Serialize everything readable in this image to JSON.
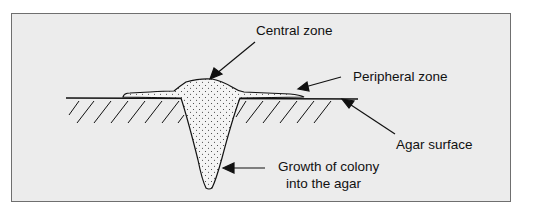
{
  "diagram": {
    "labels": {
      "central_zone": "Central zone",
      "peripheral_zone": "Peripheral zone",
      "agar_surface": "Agar surface",
      "growth_line1": "Growth of colony",
      "growth_line2": "into the agar"
    },
    "colors": {
      "background": "#ececec",
      "border": "#6f6f6f",
      "ink": "#111111"
    }
  }
}
